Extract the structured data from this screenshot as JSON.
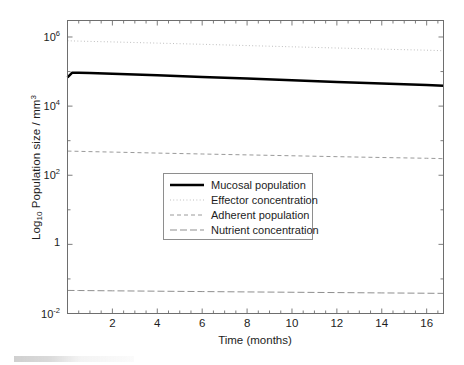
{
  "figure": {
    "background_color": "#ffffff",
    "axis_color": "#6e6e6e",
    "text_color": "#1d1d1d"
  },
  "axes": {
    "xlabel": "Time (months)",
    "ylabel_prefix": "Log",
    "ylabel_sub": "10",
    "ylabel_rest": " Population size / mm",
    "ylabel_sup": "3",
    "x_ticks": [
      2,
      4,
      6,
      8,
      10,
      12,
      14,
      16
    ],
    "y_ticks": [
      {
        "mantissa": "10",
        "exponent": "6",
        "value": 1000000
      },
      {
        "mantissa": "10",
        "exponent": "4",
        "value": 10000
      },
      {
        "mantissa": "10",
        "exponent": "2",
        "value": 100
      },
      {
        "mantissa": "1",
        "exponent": "",
        "value": 1
      },
      {
        "mantissa": "10",
        "exponent": "-2",
        "value": 0.01
      }
    ]
  },
  "legend": {
    "position": "center",
    "border_color": "#8e8e8e",
    "entries": [
      {
        "label": "Mucosal population",
        "style": "solid",
        "color": "#000000",
        "width": 2.6
      },
      {
        "label": "Effector concentration",
        "style": "dotted",
        "color": "#b9b9b9",
        "width": 1.0
      },
      {
        "label": "Adherent population",
        "style": "dashed",
        "color": "#9a9a9a",
        "width": 1.0
      },
      {
        "label": "Nutrient concentration",
        "style": "dashdot",
        "color": "#8f8f8f",
        "width": 1.0
      }
    ]
  },
  "chart_data": {
    "type": "line",
    "title": "",
    "xlabel": "Time (months)",
    "ylabel": "Log10 Population size / mm^3",
    "xlim": [
      0,
      16.75
    ],
    "ylim": [
      0.01,
      3000000
    ],
    "yscale": "log",
    "grid": false,
    "legend_position": "center",
    "x": [
      0,
      0.2,
      0.5,
      1,
      2,
      4,
      6,
      8,
      10,
      12,
      14,
      16,
      16.75
    ],
    "series": [
      {
        "name": "Mucosal population",
        "style": "solid",
        "color": "#000000",
        "values": [
          68000,
          92000,
          93000,
          91000,
          87000,
          78000,
          70000,
          63000,
          56000,
          50000,
          45000,
          41000,
          39000
        ]
      },
      {
        "name": "Effector concentration",
        "style": "dotted",
        "color": "#b9b9b9",
        "values": [
          780000,
          770000,
          760000,
          745000,
          720000,
          665000,
          615000,
          565000,
          520000,
          480000,
          445000,
          415000,
          400000
        ]
      },
      {
        "name": "Adherent population",
        "style": "dashed",
        "color": "#9a9a9a",
        "values": [
          500,
          497,
          492,
          483,
          468,
          438,
          412,
          388,
          366,
          345,
          326,
          310,
          302
        ]
      },
      {
        "name": "Nutrient concentration",
        "style": "dashdot",
        "color": "#8f8f8f",
        "values": [
          0.0465,
          0.0464,
          0.0462,
          0.0459,
          0.0453,
          0.0442,
          0.0431,
          0.0421,
          0.0412,
          0.0403,
          0.0394,
          0.0386,
          0.0382
        ]
      }
    ]
  }
}
